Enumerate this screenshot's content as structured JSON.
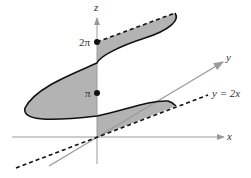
{
  "figure": {
    "axes": {
      "x_label": "x",
      "y_label": "y",
      "z_label": "z"
    },
    "ticks": {
      "two_pi": "2π",
      "pi": "π"
    },
    "line_label": "y = 2x",
    "colors": {
      "fill": "#b3b3b3",
      "axis": "#9a9a9a",
      "curve": "#111111"
    }
  }
}
